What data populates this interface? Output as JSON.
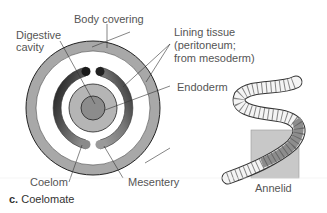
{
  "labels": {
    "body_covering": "Body covering",
    "digestive_cavity_line1": "Digestive",
    "digestive_cavity_line2": "cavity",
    "lining_line1": "Lining tissue",
    "lining_line2": "(peritoneum;",
    "lining_line3": "from mesoderm)",
    "endoderm": "Endoderm",
    "coelom": "Coelom",
    "mesentery": "Mesentery",
    "annelid": "Annelid"
  },
  "caption": {
    "letter": "c.",
    "text": "Coelomate"
  },
  "colors": {
    "body_covering": "#a8a8a8",
    "mesoderm_dark": "#2a2a2a",
    "mesoderm_mid": "#7a7a7a",
    "endoderm": "#b5b5b5",
    "gut": "#909090",
    "outline": "#222222",
    "box": "#c8c8c8"
  }
}
